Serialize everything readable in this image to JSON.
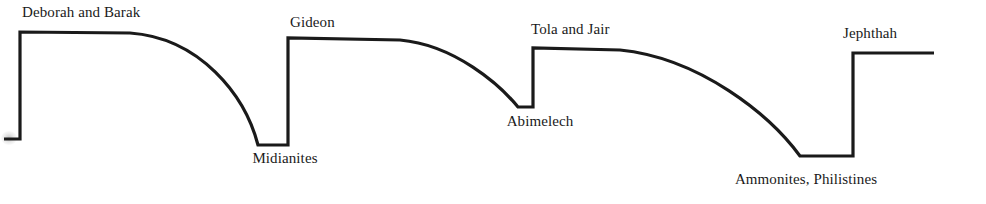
{
  "figure": {
    "background_color": "#ffffff",
    "line_color": "#1a1a1a",
    "line_width": 3.2,
    "text_color": "#1a1a1a",
    "width": 986,
    "height": 204
  },
  "chart_data": {
    "type": "line",
    "xlabel": "",
    "ylabel": "",
    "grid": false,
    "legend": false,
    "xlim": [
      0,
      986
    ],
    "ylim": [
      204,
      0
    ],
    "path": "M 4 139 L 20 139 L 20 32 L 130 33 C 200 38 245 95 258 145 L 288 145 L 288 38 L 400 40 C 455 45 500 85 518 107 L 533 107 L 533 48 L 620 50 C 700 58 770 115 800 156 L 853 156 L 853 53 L 934 53",
    "baseline_levels": {
      "start_stub": 139,
      "peak_deborah": 32,
      "trough_midianites": 145,
      "peak_gideon": 38,
      "trough_abimelech": 107,
      "peak_tola_jair": 48,
      "trough_ammonites": 156,
      "peak_jephthah": 53
    },
    "peaks": [
      {
        "name": "Deborah and Barak",
        "x": 20,
        "y": 32,
        "plateau_end_x": 130
      },
      {
        "name": "Gideon",
        "x": 288,
        "y": 38,
        "plateau_end_x": 400
      },
      {
        "name": "Tola and Jair",
        "x": 533,
        "y": 48,
        "plateau_end_x": 620
      },
      {
        "name": "Jephthah",
        "x": 853,
        "y": 53,
        "plateau_end_x": 934
      }
    ],
    "troughs": [
      {
        "name": "Midianites",
        "x_start": 258,
        "x_end": 288,
        "y": 145
      },
      {
        "name": "Abimelech",
        "x_start": 518,
        "x_end": 533,
        "y": 107
      },
      {
        "name": "Ammonites, Philistines",
        "x_start": 800,
        "x_end": 853,
        "y": 156
      }
    ]
  },
  "labels": [
    {
      "id": "deborah-and-barak",
      "text": "Deborah and Barak",
      "x": 22,
      "y": 20,
      "anchor": "start",
      "role": "peak"
    },
    {
      "id": "midianites",
      "text": "Midianites",
      "x": 285,
      "y": 166,
      "anchor": "middle",
      "role": "trough"
    },
    {
      "id": "gideon",
      "text": "Gideon",
      "x": 290,
      "y": 30,
      "anchor": "start",
      "role": "peak"
    },
    {
      "id": "abimelech",
      "text": "Abimelech",
      "x": 540,
      "y": 129,
      "anchor": "middle",
      "role": "trough"
    },
    {
      "id": "tola-and-jair",
      "text": "Tola and Jair",
      "x": 531,
      "y": 37,
      "anchor": "start",
      "role": "peak"
    },
    {
      "id": "ammonites-philistines",
      "text": "Ammonites, Philistines",
      "x": 806,
      "y": 187,
      "anchor": "middle",
      "role": "trough"
    },
    {
      "id": "jephthah",
      "text": "Jephthah",
      "x": 843,
      "y": 41,
      "anchor": "start",
      "role": "peak"
    }
  ],
  "artifacts": [
    {
      "id": "scan-smudge",
      "x": 1,
      "y": 131,
      "note": "faint gray scan smudge at left edge"
    }
  ]
}
